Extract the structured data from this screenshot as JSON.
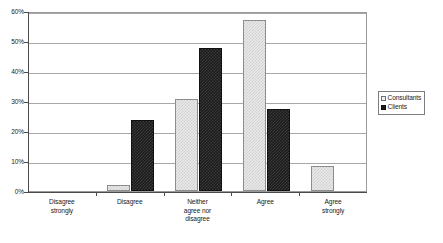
{
  "chart_data": {
    "type": "bar",
    "title": "",
    "xlabel": "",
    "ylabel": "",
    "ylim": [
      0,
      60
    ],
    "ytick_labels": [
      "0%",
      "10%",
      "20%",
      "30%",
      "40%",
      "50%",
      "60%"
    ],
    "ytick_values": [
      0,
      10,
      20,
      30,
      40,
      50,
      60
    ],
    "grid": true,
    "legend_position": "right",
    "categories": [
      "Disagree strongly",
      "Disagree",
      "Neither agree nor disagree",
      "Agree",
      "Agree strongly"
    ],
    "category_lines": [
      [
        "Disagree",
        "strongly"
      ],
      [
        "Disagree"
      ],
      [
        "Neither",
        "agree nor",
        "disagree"
      ],
      [
        "Agree"
      ],
      [
        "Agree",
        "strongly"
      ]
    ],
    "series": [
      {
        "name": "Consultants",
        "color": "#e9e9e9",
        "values": [
          0,
          2.0,
          30.7,
          57.1,
          8.3
        ]
      },
      {
        "name": "Clients",
        "color": "#1b1b1b",
        "values": [
          0,
          23.8,
          47.6,
          27.4,
          0
        ]
      }
    ]
  },
  "legend": {
    "items": [
      {
        "label": "Consultants"
      },
      {
        "label": "Clients"
      }
    ]
  }
}
